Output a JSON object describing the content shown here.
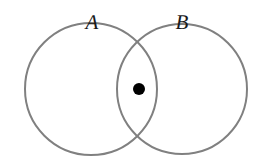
{
  "figure": {
    "type": "venn-diagram",
    "width": 263,
    "height": 162,
    "background_color": "#ffffff",
    "stroke_color": "#808080",
    "stroke_width": 2,
    "dot_color": "#000000",
    "label_color": "#1a1a1a"
  },
  "sets": [
    {
      "id": "A",
      "label": "A",
      "label_x": 92,
      "label_y": 22,
      "center_x": 91,
      "center_y": 89,
      "radius": 66
    },
    {
      "id": "B",
      "label": "B",
      "label_x": 182,
      "label_y": 22,
      "center_x": 182,
      "center_y": 89,
      "radius": 65
    }
  ],
  "points": [
    {
      "id": "intersection-point",
      "x": 139,
      "y": 89,
      "radius": 6,
      "region": "A-intersect-B"
    }
  ]
}
